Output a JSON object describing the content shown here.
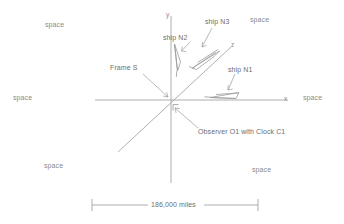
{
  "figure": {
    "title_text": "",
    "background_color": "#ffffff",
    "line_color": "#9a9a9a",
    "text_color": "#8a8a8a"
  },
  "axes": {
    "x_label": "x",
    "y_label": "y",
    "z_label": "z",
    "origin": {
      "x": 171,
      "y": 100
    },
    "x_axis": {
      "x1": 95,
      "y1": 100,
      "x2": 288,
      "y2": 100
    },
    "y_axis": {
      "x1": 171,
      "y1": 16,
      "x2": 171,
      "y2": 183
    },
    "z_axis": {
      "x1": 118,
      "y1": 152,
      "x2": 230,
      "y2": 48
    }
  },
  "labels": {
    "frame": "Frame S",
    "observer": "Observer O1 with Clock C1",
    "ship_n1": "ship N1",
    "ship_n2": "ship N2",
    "ship_n3": "ship N3",
    "space": "space"
  },
  "space_labels": [
    {
      "text": "space",
      "x": 45,
      "y": 22,
      "position": "top-left"
    },
    {
      "text": "space",
      "x": 250,
      "y": 17,
      "position": "top-right"
    },
    {
      "text": "space",
      "x": 13,
      "y": 95,
      "position": "mid-left"
    },
    {
      "text": "space",
      "x": 303,
      "y": 95,
      "position": "mid-right"
    },
    {
      "text": "space",
      "x": 44,
      "y": 163,
      "position": "bottom-left"
    },
    {
      "text": "space",
      "x": 252,
      "y": 167,
      "position": "bottom-right"
    }
  ],
  "scale_bar": {
    "label": "186,000 miles",
    "left_x": 92,
    "right_x": 258,
    "y": 205
  },
  "ships": [
    {
      "name": "ship N1",
      "label_x": 228,
      "label_y": 70,
      "orientation": "horizontal-along-x"
    },
    {
      "name": "ship N2",
      "label_x": 162,
      "label_y": 35,
      "orientation": "vertical-along-y"
    },
    {
      "name": "ship N3",
      "label_x": 205,
      "label_y": 19,
      "orientation": "diagonal-along-z"
    }
  ],
  "annotations": {
    "frame_s_label_x": 110,
    "frame_s_label_y": 68,
    "observer_label_x": 198,
    "observer_label_y": 131
  }
}
